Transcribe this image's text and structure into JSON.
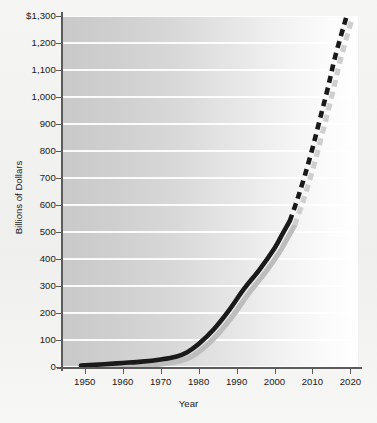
{
  "chart_data": {
    "type": "line",
    "title": "",
    "xlabel": "Year",
    "ylabel": "Billions of Dollars",
    "xlim": [
      1944,
      2022
    ],
    "ylim": [
      0,
      1300
    ],
    "grid": true,
    "legend": "none",
    "x_ticks": [
      "1950",
      "1960",
      "1970",
      "1980",
      "1990",
      "2000",
      "2010",
      "2020"
    ],
    "x_tick_values": [
      1950,
      1960,
      1970,
      1980,
      1990,
      2000,
      2010,
      2020
    ],
    "y_ticks": [
      "0",
      "100",
      "200",
      "300",
      "400",
      "500",
      "600",
      "700",
      "800",
      "900",
      "1,000",
      "1,100",
      "1,200",
      "$1,300"
    ],
    "y_tick_values": [
      0,
      100,
      200,
      300,
      400,
      500,
      600,
      700,
      800,
      900,
      1000,
      1100,
      1200,
      1300
    ],
    "series": [
      {
        "name": "Actual",
        "style": "solid",
        "color": "#1a1a1a",
        "x": [
          1949,
          1955,
          1960,
          1965,
          1970,
          1974,
          1977,
          1980,
          1984,
          1988,
          1992,
          1996,
          2000,
          2002,
          2004
        ],
        "values": [
          5,
          10,
          15,
          20,
          28,
          38,
          55,
          85,
          140,
          210,
          290,
          360,
          440,
          490,
          540
        ]
      },
      {
        "name": "Projected",
        "style": "dashed",
        "color": "#1a1a1a",
        "x": [
          2004,
          2006,
          2008,
          2010,
          2012,
          2014,
          2016,
          2019
        ],
        "values": [
          540,
          620,
          710,
          810,
          920,
          1030,
          1150,
          1300
        ]
      }
    ],
    "shadow_color": "#bdbdbd",
    "background_gradient": [
      "#c9c9c9",
      "#ffffff"
    ],
    "gridline_color": "#ffffff",
    "axis_color": "#5b5b5b"
  }
}
